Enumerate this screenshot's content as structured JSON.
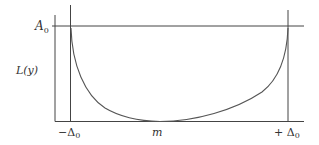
{
  "diagram": {
    "type": "function-plot",
    "y_axis_label": "L(y)",
    "top_level_label": "A",
    "top_level_subscript": "0",
    "x_labels": {
      "left": {
        "prefix": "−",
        "symbol": "Δ",
        "subscript": "0"
      },
      "middle": {
        "text": "m"
      },
      "right": {
        "prefix": "+ ",
        "symbol": "Δ",
        "subscript": "0"
      }
    },
    "colors": {
      "line": "#444444",
      "curve": "#555555",
      "text": "#333333",
      "background": "#ffffff"
    }
  }
}
